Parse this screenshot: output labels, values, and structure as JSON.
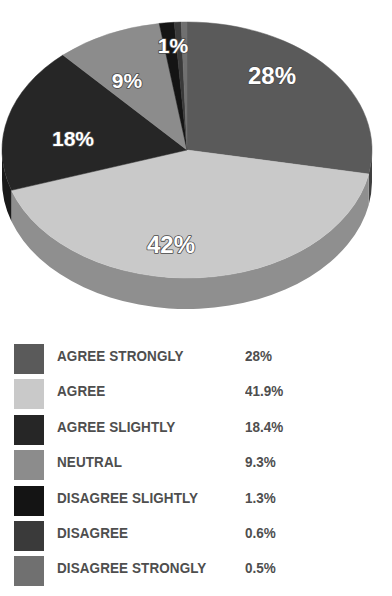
{
  "chart_data": {
    "type": "pie",
    "title": "",
    "xlabel": "",
    "ylabel": "",
    "legend_position": "bottom",
    "grid": false,
    "three_d": true,
    "categories": [
      "AGREE STRONGLY",
      "AGREE",
      "AGREE SLIGHTLY",
      "NEUTRAL",
      "DISAGREE SLIGHTLY",
      "DISAGREE",
      "DISAGREE STRONGLY"
    ],
    "values": [
      28.0,
      41.9,
      18.4,
      9.3,
      1.3,
      0.6,
      0.5
    ],
    "value_labels": [
      "28%",
      "41.9%",
      "18.4%",
      "9.3%",
      "1.3%",
      "0.6%",
      "0.5%"
    ],
    "slice_labels": [
      "28%",
      "42%",
      "18%",
      "9%",
      "1%",
      "",
      ""
    ],
    "colors": [
      "#5a5a5a",
      "#c9c9c9",
      "#262626",
      "#8c8c8c",
      "#141414",
      "#3a3a3a",
      "#707070"
    ],
    "side_colors": [
      "#3f3f3f",
      "#8f8f8f",
      "#1a1a1a",
      "#636363",
      "#0d0d0d",
      "#292929",
      "#4f4f4f"
    ]
  },
  "legend": {
    "rows": [
      {
        "label": "AGREE STRONGLY",
        "value": "28%",
        "color": "#5a5a5a"
      },
      {
        "label": "AGREE",
        "value": "41.9%",
        "color": "#c9c9c9"
      },
      {
        "label": "AGREE SLIGHTLY",
        "value": "18.4%",
        "color": "#262626"
      },
      {
        "label": "NEUTRAL",
        "value": "9.3%",
        "color": "#8c8c8c"
      },
      {
        "label": "DISAGREE SLIGHTLY",
        "value": "1.3%",
        "color": "#141414"
      },
      {
        "label": "DISAGREE",
        "value": "0.6%",
        "color": "#3a3a3a"
      },
      {
        "label": "DISAGREE STRONGLY",
        "value": "0.5%",
        "color": "#707070"
      }
    ]
  },
  "pie_labels": [
    {
      "text": "28%",
      "x": 272,
      "y": 84,
      "size": 24
    },
    {
      "text": "42%",
      "x": 171,
      "y": 253,
      "size": 24
    },
    {
      "text": "18%",
      "x": 73,
      "y": 146,
      "size": 21
    },
    {
      "text": "9%",
      "x": 127,
      "y": 88,
      "size": 21
    },
    {
      "text": "1%",
      "x": 173,
      "y": 53,
      "size": 21
    }
  ]
}
